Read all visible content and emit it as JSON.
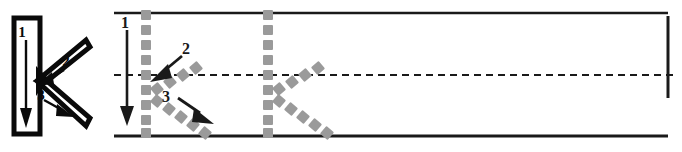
{
  "worksheet": {
    "letter": "K",
    "letter_case": "uppercase",
    "title": "Letter K stroke order handwriting practice row",
    "stroke_count": 3,
    "stroke_numbers": [
      "1",
      "2",
      "3"
    ],
    "strokes": [
      {
        "number": "1",
        "name": "vertical-downstroke",
        "direction": "top-to-bottom"
      },
      {
        "number": "2",
        "name": "upper-diagonal-instroke",
        "direction": "upper-right-to-center"
      },
      {
        "number": "3",
        "name": "lower-diagonal-outstroke",
        "direction": "center-to-lower-right"
      }
    ]
  },
  "model": {
    "name": "model-letter-k",
    "number_labels": [
      "1",
      "2",
      "3"
    ],
    "outline_color": "#0a0a0a",
    "fill_color": "#ffffff",
    "arrow_color": "#0a0a0a"
  },
  "rules": {
    "top_line_color": "#1a1a1a",
    "baseline_color": "#1a1a1a",
    "midline_color": "#1a1a1a",
    "midline_style": "dashed",
    "top_line_y": 13,
    "midline_y": 75,
    "baseline_y": 136,
    "right_margin_color": "#1a1a1a"
  },
  "traces": [
    {
      "name": "traced-letter-k-first",
      "has_stroke_arrows": true,
      "dot_color": "#9a9a9a",
      "number_labels": [
        "1",
        "2",
        "3"
      ],
      "arrow_color": "#1a1a1a"
    },
    {
      "name": "traced-letter-k-second",
      "has_stroke_arrows": false,
      "dot_color": "#9a9a9a",
      "number_labels": [],
      "arrow_color": ""
    }
  ],
  "colors": {
    "ink": "#0a0a0a",
    "rule": "#1a1a1a",
    "guide_dot": "#9a9a9a",
    "paper": "#ffffff"
  }
}
